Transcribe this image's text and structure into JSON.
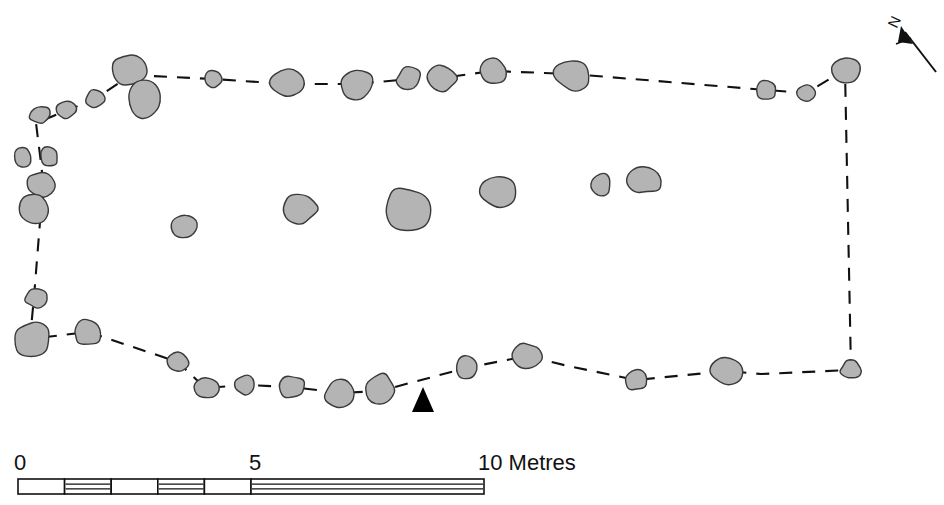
{
  "figure": {
    "type": "archaeological-site-plan",
    "background_color": "#ffffff",
    "stone_fill_color": "#b4b4b4",
    "stone_outline_color": "#3a3a3a",
    "line_color": "#111111"
  },
  "north_arrow": {
    "label": "N",
    "description": "north-arrow pointing up and to the left",
    "bearing_degrees": 335
  },
  "entrance_marker": {
    "description": "solid black arrow indicating entrance through the southern enclosure wall",
    "direction": "up"
  },
  "scale_bar": {
    "unit_label": "Metres",
    "ticks": [
      "0",
      "5",
      "10 Metres"
    ],
    "tick_values": [
      0,
      5,
      10
    ],
    "total_metres": 10,
    "segments_left_half": 5,
    "segments_right_half": 1
  },
  "chart_data": {
    "type": "scatter",
    "title": "",
    "xlabel": "",
    "ylabel": "",
    "grid": false,
    "legend": "none",
    "enclosure_outline": [
      [
        131,
        75
      ],
      [
        213,
        79
      ],
      [
        288,
        84
      ],
      [
        357,
        84
      ],
      [
        409,
        79
      ],
      [
        442,
        78
      ],
      [
        492,
        71
      ],
      [
        572,
        74
      ],
      [
        766,
        90
      ],
      [
        806,
        93
      ],
      [
        845,
        70
      ],
      [
        851,
        370
      ],
      [
        761,
        374
      ],
      [
        727,
        371
      ],
      [
        636,
        380
      ],
      [
        568,
        366
      ],
      [
        527,
        356
      ],
      [
        466,
        368
      ],
      [
        380,
        391
      ],
      [
        341,
        393
      ],
      [
        292,
        387
      ],
      [
        245,
        385
      ],
      [
        205,
        388
      ],
      [
        178,
        362
      ],
      [
        88,
        332
      ],
      [
        30,
        339
      ],
      [
        34,
        297
      ],
      [
        40,
        222
      ],
      [
        44,
        190
      ],
      [
        41,
        163
      ],
      [
        36,
        123
      ],
      [
        95,
        99
      ],
      [
        131,
        75
      ]
    ],
    "perimeter_stones": [
      {
        "cx": 131,
        "cy": 70,
        "rx": 19,
        "ry": 17,
        "seed": 11
      },
      {
        "cx": 145,
        "cy": 100,
        "rx": 19,
        "ry": 19,
        "seed": 12
      },
      {
        "cx": 95,
        "cy": 99,
        "rx": 10,
        "ry": 10,
        "seed": 13
      },
      {
        "cx": 66,
        "cy": 110,
        "rx": 11,
        "ry": 9,
        "seed": 14
      },
      {
        "cx": 40,
        "cy": 115,
        "rx": 11,
        "ry": 10,
        "seed": 15
      },
      {
        "cx": 23,
        "cy": 157,
        "rx": 9,
        "ry": 10,
        "seed": 16
      },
      {
        "cx": 49,
        "cy": 156,
        "rx": 10,
        "ry": 11,
        "seed": 17
      },
      {
        "cx": 41,
        "cy": 184,
        "rx": 14,
        "ry": 13,
        "seed": 18
      },
      {
        "cx": 33,
        "cy": 210,
        "rx": 16,
        "ry": 15,
        "seed": 19
      },
      {
        "cx": 36,
        "cy": 298,
        "rx": 12,
        "ry": 10,
        "seed": 20
      },
      {
        "cx": 32,
        "cy": 340,
        "rx": 19,
        "ry": 18,
        "seed": 21
      },
      {
        "cx": 88,
        "cy": 333,
        "rx": 16,
        "ry": 14,
        "seed": 22
      },
      {
        "cx": 178,
        "cy": 362,
        "rx": 11,
        "ry": 10,
        "seed": 23
      },
      {
        "cx": 206,
        "cy": 388,
        "rx": 14,
        "ry": 12,
        "seed": 24
      },
      {
        "cx": 245,
        "cy": 385,
        "rx": 10,
        "ry": 11,
        "seed": 25
      },
      {
        "cx": 292,
        "cy": 387,
        "rx": 14,
        "ry": 12,
        "seed": 26
      },
      {
        "cx": 341,
        "cy": 393,
        "rx": 17,
        "ry": 15,
        "seed": 27
      },
      {
        "cx": 380,
        "cy": 390,
        "rx": 15,
        "ry": 17,
        "seed": 28
      },
      {
        "cx": 213,
        "cy": 79,
        "rx": 10,
        "ry": 9,
        "seed": 29
      },
      {
        "cx": 288,
        "cy": 84,
        "rx": 18,
        "ry": 15,
        "seed": 30
      },
      {
        "cx": 357,
        "cy": 84,
        "rx": 18,
        "ry": 16,
        "seed": 31
      },
      {
        "cx": 409,
        "cy": 79,
        "rx": 13,
        "ry": 12,
        "seed": 32
      },
      {
        "cx": 442,
        "cy": 78,
        "rx": 16,
        "ry": 14,
        "seed": 33
      },
      {
        "cx": 492,
        "cy": 71,
        "rx": 15,
        "ry": 14,
        "seed": 34
      },
      {
        "cx": 572,
        "cy": 74,
        "rx": 19,
        "ry": 17,
        "seed": 35
      },
      {
        "cx": 766,
        "cy": 90,
        "rx": 11,
        "ry": 10,
        "seed": 36
      },
      {
        "cx": 806,
        "cy": 93,
        "rx": 9,
        "ry": 8,
        "seed": 37
      },
      {
        "cx": 845,
        "cy": 70,
        "rx": 15,
        "ry": 14,
        "seed": 38
      },
      {
        "cx": 851,
        "cy": 370,
        "rx": 11,
        "ry": 10,
        "seed": 39
      },
      {
        "cx": 727,
        "cy": 371,
        "rx": 18,
        "ry": 15,
        "seed": 40
      },
      {
        "cx": 636,
        "cy": 380,
        "rx": 13,
        "ry": 11,
        "seed": 41
      },
      {
        "cx": 527,
        "cy": 356,
        "rx": 15,
        "ry": 13,
        "seed": 42
      },
      {
        "cx": 466,
        "cy": 368,
        "rx": 11,
        "ry": 13,
        "seed": 43
      }
    ],
    "internal_stones": [
      {
        "cx": 186,
        "cy": 226,
        "rx": 14,
        "ry": 13,
        "seed": 51
      },
      {
        "cx": 300,
        "cy": 209,
        "rx": 18,
        "ry": 15,
        "seed": 52
      },
      {
        "cx": 406,
        "cy": 209,
        "rx": 25,
        "ry": 24,
        "seed": 53
      },
      {
        "cx": 498,
        "cy": 191,
        "rx": 19,
        "ry": 16,
        "seed": 54
      },
      {
        "cx": 600,
        "cy": 185,
        "rx": 11,
        "ry": 12,
        "seed": 55
      },
      {
        "cx": 646,
        "cy": 180,
        "rx": 19,
        "ry": 14,
        "seed": 56
      }
    ],
    "counts": {
      "perimeter_stones": 33,
      "internal_stones": 6,
      "total_stones": 39
    }
  }
}
